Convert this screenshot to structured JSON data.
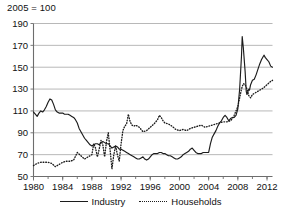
{
  "chart_data": {
    "type": "line",
    "title": "2005 = 100",
    "xlabel": "",
    "ylabel": "",
    "xlim": [
      1980,
      2012.75
    ],
    "ylim": [
      50,
      190
    ],
    "ytick_step": 20,
    "yticks": [
      50,
      70,
      90,
      110,
      130,
      150,
      170,
      190
    ],
    "xticks": [
      1980,
      1984,
      1988,
      1992,
      1996,
      2000,
      2004,
      2008,
      2012
    ],
    "x_minor_tick_step": 2,
    "grid": "horizontal",
    "legend_position": "bottom-center",
    "series": [
      {
        "name": "Industry",
        "style": "solid",
        "color": "#1c1c1c",
        "points": [
          [
            1980.0,
            109
          ],
          [
            1980.25,
            107
          ],
          [
            1980.5,
            105
          ],
          [
            1980.75,
            108
          ],
          [
            1981.0,
            110
          ],
          [
            1981.25,
            109
          ],
          [
            1981.5,
            111
          ],
          [
            1981.75,
            114
          ],
          [
            1982.0,
            118
          ],
          [
            1982.25,
            121
          ],
          [
            1982.5,
            120
          ],
          [
            1982.75,
            116
          ],
          [
            1983.0,
            111
          ],
          [
            1983.25,
            109
          ],
          [
            1983.5,
            108
          ],
          [
            1983.75,
            108
          ],
          [
            1984.0,
            108
          ],
          [
            1984.25,
            107
          ],
          [
            1984.5,
            107
          ],
          [
            1984.75,
            107
          ],
          [
            1985.0,
            106
          ],
          [
            1985.25,
            105
          ],
          [
            1985.5,
            104
          ],
          [
            1985.75,
            102
          ],
          [
            1986.0,
            99
          ],
          [
            1986.25,
            94
          ],
          [
            1986.5,
            91
          ],
          [
            1986.75,
            88
          ],
          [
            1987.0,
            85
          ],
          [
            1987.25,
            83
          ],
          [
            1987.5,
            81
          ],
          [
            1987.75,
            79
          ],
          [
            1988.0,
            78
          ],
          [
            1988.25,
            79
          ],
          [
            1988.5,
            80
          ],
          [
            1988.75,
            80
          ],
          [
            1989.0,
            79
          ],
          [
            1989.25,
            81
          ],
          [
            1989.5,
            82
          ],
          [
            1989.75,
            81
          ],
          [
            1990.0,
            80
          ],
          [
            1990.25,
            80
          ],
          [
            1990.5,
            78
          ],
          [
            1990.75,
            76
          ],
          [
            1991.0,
            77
          ],
          [
            1991.25,
            78
          ],
          [
            1991.5,
            77
          ],
          [
            1991.75,
            75
          ],
          [
            1992.0,
            75
          ],
          [
            1992.25,
            74
          ],
          [
            1992.5,
            73
          ],
          [
            1992.75,
            72
          ],
          [
            1993.0,
            71
          ],
          [
            1993.25,
            70
          ],
          [
            1993.5,
            69
          ],
          [
            1993.75,
            68
          ],
          [
            1994.0,
            67
          ],
          [
            1994.25,
            66
          ],
          [
            1994.5,
            66
          ],
          [
            1994.75,
            67
          ],
          [
            1995.0,
            68
          ],
          [
            1995.25,
            66
          ],
          [
            1995.5,
            65
          ],
          [
            1995.75,
            66
          ],
          [
            1996.0,
            68
          ],
          [
            1996.25,
            70
          ],
          [
            1996.5,
            71
          ],
          [
            1996.75,
            71
          ],
          [
            1997.0,
            71
          ],
          [
            1997.25,
            72
          ],
          [
            1997.5,
            72
          ],
          [
            1997.75,
            71
          ],
          [
            1998.0,
            71
          ],
          [
            1998.25,
            70
          ],
          [
            1998.5,
            69
          ],
          [
            1998.75,
            69
          ],
          [
            1999.0,
            68
          ],
          [
            1999.25,
            67
          ],
          [
            1999.5,
            66
          ],
          [
            1999.75,
            66
          ],
          [
            2000.0,
            67
          ],
          [
            2000.25,
            68
          ],
          [
            2000.5,
            70
          ],
          [
            2000.75,
            71
          ],
          [
            2001.0,
            72
          ],
          [
            2001.25,
            73
          ],
          [
            2001.5,
            75
          ],
          [
            2001.75,
            76
          ],
          [
            2002.0,
            74
          ],
          [
            2002.25,
            72
          ],
          [
            2002.5,
            71
          ],
          [
            2002.75,
            71
          ],
          [
            2003.0,
            71
          ],
          [
            2003.25,
            72
          ],
          [
            2003.5,
            72
          ],
          [
            2003.75,
            72
          ],
          [
            2004.0,
            72
          ],
          [
            2004.25,
            80
          ],
          [
            2004.5,
            86
          ],
          [
            2004.75,
            89
          ],
          [
            2005.0,
            92
          ],
          [
            2005.25,
            96
          ],
          [
            2005.5,
            99
          ],
          [
            2005.75,
            101
          ],
          [
            2006.0,
            104
          ],
          [
            2006.25,
            106
          ],
          [
            2006.5,
            104
          ],
          [
            2006.75,
            101
          ],
          [
            2007.0,
            103
          ],
          [
            2007.25,
            104
          ],
          [
            2007.5,
            104
          ],
          [
            2007.75,
            106
          ],
          [
            2008.0,
            112
          ],
          [
            2008.25,
            130
          ],
          [
            2008.5,
            160
          ],
          [
            2008.6,
            178
          ],
          [
            2008.75,
            168
          ],
          [
            2009.0,
            146
          ],
          [
            2009.15,
            128
          ],
          [
            2009.25,
            125
          ],
          [
            2009.5,
            130
          ],
          [
            2009.6,
            129
          ],
          [
            2009.75,
            134
          ],
          [
            2010.0,
            138
          ],
          [
            2010.25,
            139
          ],
          [
            2010.5,
            143
          ],
          [
            2010.75,
            148
          ],
          [
            2011.0,
            153
          ],
          [
            2011.25,
            157
          ],
          [
            2011.5,
            160
          ],
          [
            2011.6,
            161
          ],
          [
            2011.75,
            159
          ],
          [
            2012.0,
            157
          ],
          [
            2012.25,
            155
          ],
          [
            2012.5,
            151
          ],
          [
            2012.75,
            150
          ]
        ]
      },
      {
        "name": "Households",
        "style": "dotted",
        "color": "#1c1c1c",
        "points": [
          [
            1980.0,
            60
          ],
          [
            1980.5,
            62
          ],
          [
            1981.0,
            63
          ],
          [
            1981.5,
            63
          ],
          [
            1982.0,
            63
          ],
          [
            1982.5,
            62
          ],
          [
            1983.0,
            59
          ],
          [
            1983.5,
            61
          ],
          [
            1984.0,
            63
          ],
          [
            1984.5,
            64
          ],
          [
            1985.0,
            64
          ],
          [
            1985.5,
            65
          ],
          [
            1986.0,
            72
          ],
          [
            1986.5,
            69
          ],
          [
            1987.0,
            66
          ],
          [
            1987.5,
            68
          ],
          [
            1988.0,
            70
          ],
          [
            1988.25,
            80
          ],
          [
            1988.5,
            76
          ],
          [
            1988.75,
            68
          ],
          [
            1989.0,
            75
          ],
          [
            1989.25,
            83
          ],
          [
            1989.5,
            79
          ],
          [
            1989.75,
            68
          ],
          [
            1990.0,
            82
          ],
          [
            1990.25,
            90
          ],
          [
            1990.5,
            74
          ],
          [
            1990.75,
            57
          ],
          [
            1991.0,
            70
          ],
          [
            1991.25,
            78
          ],
          [
            1991.5,
            70
          ],
          [
            1991.75,
            64
          ],
          [
            1992.0,
            80
          ],
          [
            1992.25,
            92
          ],
          [
            1992.5,
            96
          ],
          [
            1992.75,
            98
          ],
          [
            1993.0,
            107
          ],
          [
            1993.25,
            100
          ],
          [
            1993.5,
            97
          ],
          [
            1993.75,
            96
          ],
          [
            1994.0,
            97
          ],
          [
            1994.5,
            95
          ],
          [
            1995.0,
            91
          ],
          [
            1995.5,
            92
          ],
          [
            1996.0,
            95
          ],
          [
            1996.5,
            98
          ],
          [
            1997.0,
            102
          ],
          [
            1997.25,
            106
          ],
          [
            1997.5,
            104
          ],
          [
            1997.75,
            101
          ],
          [
            1998.0,
            99
          ],
          [
            1998.5,
            98
          ],
          [
            1999.0,
            96
          ],
          [
            1999.5,
            93
          ],
          [
            2000.0,
            92
          ],
          [
            2000.5,
            93
          ],
          [
            2001.0,
            92
          ],
          [
            2001.5,
            94
          ],
          [
            2002.0,
            95
          ],
          [
            2002.5,
            96
          ],
          [
            2003.0,
            97
          ],
          [
            2003.5,
            95
          ],
          [
            2004.0,
            96
          ],
          [
            2004.5,
            97
          ],
          [
            2005.0,
            98
          ],
          [
            2005.5,
            99
          ],
          [
            2006.0,
            100
          ],
          [
            2006.5,
            100
          ],
          [
            2007.0,
            101
          ],
          [
            2007.25,
            103
          ],
          [
            2007.5,
            106
          ],
          [
            2007.75,
            110
          ],
          [
            2008.0,
            114
          ],
          [
            2008.25,
            122
          ],
          [
            2008.5,
            130
          ],
          [
            2008.75,
            135
          ],
          [
            2009.0,
            134
          ],
          [
            2009.25,
            130
          ],
          [
            2009.5,
            124
          ],
          [
            2009.75,
            122
          ],
          [
            2010.0,
            125
          ],
          [
            2010.5,
            127
          ],
          [
            2011.0,
            129
          ],
          [
            2011.5,
            131
          ],
          [
            2012.0,
            134
          ],
          [
            2012.5,
            137
          ],
          [
            2012.75,
            138
          ]
        ]
      }
    ]
  },
  "legend": {
    "industry_label": "Industry",
    "households_label": "Households"
  }
}
